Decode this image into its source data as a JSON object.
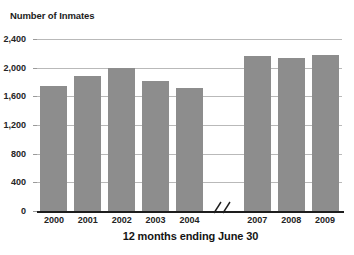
{
  "chart_data": {
    "type": "bar",
    "title": "Number of Inmates",
    "xlabel": "12 months ending June 30",
    "ylabel": "Number of Inmates",
    "categories": [
      "2000",
      "2001",
      "2002",
      "2003",
      "2004",
      "2007",
      "2008",
      "2009"
    ],
    "values": [
      1740,
      1890,
      2000,
      1810,
      1720,
      2160,
      2130,
      2180
    ],
    "ylim": [
      0,
      2400
    ],
    "ytick_labels": [
      "0",
      "400",
      "800",
      "1,200",
      "1,600",
      "2,000",
      "2,400"
    ],
    "ytick_values": [
      0,
      400,
      800,
      1200,
      1600,
      2000,
      2400
    ],
    "grid": true,
    "legend": "none",
    "axis_break": {
      "present": true,
      "between": [
        "2004",
        "2007"
      ],
      "glyph": "//"
    },
    "bar_color": "#8d8d8d",
    "gridline_color": "#b9b9b9",
    "axis_color": "#1d1d1d"
  },
  "bars": [
    {
      "label": "2000",
      "value": 1740
    },
    {
      "label": "2001",
      "value": 1890
    },
    {
      "label": "2002",
      "value": 2000
    },
    {
      "label": "2003",
      "value": 1810
    },
    {
      "label": "2004",
      "value": 1720
    },
    {
      "label": "2007",
      "value": 2160
    },
    {
      "label": "2008",
      "value": 2130
    },
    {
      "label": "2009",
      "value": 2180
    }
  ],
  "yticks": [
    {
      "label": "2,400",
      "value": 2400
    },
    {
      "label": "2,000",
      "value": 2000
    },
    {
      "label": "1,600",
      "value": 1600
    },
    {
      "label": "1,200",
      "value": 1200
    },
    {
      "label": "800",
      "value": 800
    },
    {
      "label": "400",
      "value": 400
    },
    {
      "label": "0",
      "value": 0
    }
  ]
}
